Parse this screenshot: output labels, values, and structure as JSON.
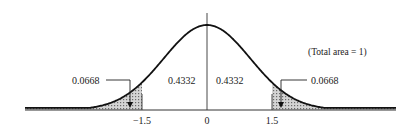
{
  "figure": {
    "note": "(Total area = 1)"
  },
  "axis": {
    "ticks": [
      {
        "value": -1.5,
        "label": "−1.5"
      },
      {
        "value": 0,
        "label": "0"
      },
      {
        "value": 1.5,
        "label": "1.5"
      }
    ]
  },
  "regions": {
    "left_tail": {
      "label": "0.0668",
      "from": "-inf",
      "to": -1.5
    },
    "left_center": {
      "label": "0.4332",
      "from": -1.5,
      "to": 0
    },
    "right_center": {
      "label": "0.4332",
      "from": 0,
      "to": 1.5
    },
    "right_tail": {
      "label": "0.0668",
      "from": 1.5,
      "to": "inf"
    }
  },
  "colors": {
    "curve": "#111111",
    "shade": "#9a9a9a",
    "axis": "#333333"
  }
}
